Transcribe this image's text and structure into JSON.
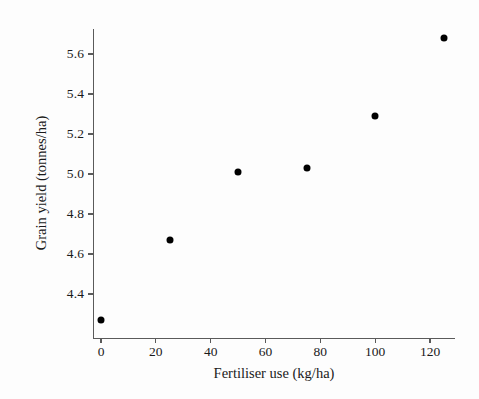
{
  "chart_data": {
    "type": "scatter",
    "title": "",
    "xlabel": "Fertiliser use (kg/ha)",
    "ylabel": "Grain yield (tonnes/ha)",
    "xlim": [
      -5,
      130
    ],
    "ylim": [
      4.25,
      5.75
    ],
    "grid": false,
    "legend": null,
    "marker": {
      "shape": "circle",
      "color": "#000000",
      "size_px": 7
    },
    "x": [
      0,
      25,
      50,
      75,
      100,
      125
    ],
    "y": [
      4.27,
      4.67,
      5.01,
      5.03,
      5.29,
      5.68
    ],
    "points": [
      {
        "x": 0,
        "y": 4.27
      },
      {
        "x": 25,
        "y": 4.67
      },
      {
        "x": 50,
        "y": 5.01
      },
      {
        "x": 75,
        "y": 5.03
      },
      {
        "x": 100,
        "y": 5.29
      },
      {
        "x": 125,
        "y": 5.68
      }
    ],
    "xticks": [
      {
        "value": 0,
        "label": "0"
      },
      {
        "value": 20,
        "label": "20"
      },
      {
        "value": 40,
        "label": "40"
      },
      {
        "value": 60,
        "label": "60"
      },
      {
        "value": 80,
        "label": "80"
      },
      {
        "value": 100,
        "label": "100"
      },
      {
        "value": 120,
        "label": "120"
      }
    ],
    "yticks": [
      {
        "value": 4.4,
        "label": "4.4"
      },
      {
        "value": 4.6,
        "label": "4.6"
      },
      {
        "value": 4.8,
        "label": "4.8"
      },
      {
        "value": 5.0,
        "label": "5.0"
      },
      {
        "value": 5.2,
        "label": "5.2"
      },
      {
        "value": 5.4,
        "label": "5.4"
      },
      {
        "value": 5.6,
        "label": "5.6"
      }
    ]
  },
  "style": {
    "background": "#fdfdfd",
    "axis_color": "#5a5a5a",
    "text_color": "#1a1a1a",
    "marker_color": "#000000"
  }
}
